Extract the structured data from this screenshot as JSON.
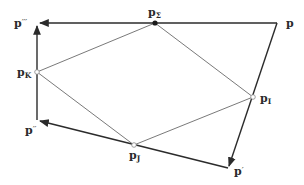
{
  "diagram": {
    "colors": {
      "arrow": "#2b2b2b",
      "thin": "#6a6a6a",
      "label": "#2a2a2a",
      "background": "#ffffff"
    },
    "points": {
      "p": {
        "base": "p",
        "sub": "",
        "sup": "",
        "x": 277,
        "y": 23
      },
      "p_sigma": {
        "base": "p",
        "sub": "Σ",
        "sup": "",
        "x": 155,
        "y": 23
      },
      "p_triple": {
        "base": "p",
        "sub": "",
        "sup": "′′′",
        "x": 37,
        "y": 23
      },
      "p_K": {
        "base": "p",
        "sub": "K",
        "sup": "",
        "x": 37,
        "y": 72
      },
      "p_double": {
        "base": "p",
        "sub": "",
        "sup": "′′",
        "x": 37,
        "y": 120
      },
      "p_J": {
        "base": "p",
        "sub": "J",
        "sup": "",
        "x": 134,
        "y": 145
      },
      "p_I": {
        "base": "p",
        "sub": "I",
        "sup": "",
        "x": 253,
        "y": 97
      },
      "p_prime": {
        "base": "p",
        "sub": "",
        "sup": "′",
        "x": 228,
        "y": 168
      }
    },
    "labels": {
      "p": "p",
      "p_sigma_base": "p",
      "p_sigma_sub": "Σ",
      "p_triple_base": "p",
      "p_triple_sup": "′′′",
      "p_K_base": "p",
      "p_K_sub": "K",
      "p_double_base": "p",
      "p_double_sup": "′′",
      "p_J_base": "p",
      "p_J_sub": "J",
      "p_I_base": "p",
      "p_I_sub": "I",
      "p_prime_base": "p",
      "p_prime_sup": "′"
    },
    "arrows": [
      {
        "from": "p",
        "to": "p_triple"
      },
      {
        "from": "p",
        "to": "p_prime"
      },
      {
        "from": "p_prime",
        "to": "p_double"
      },
      {
        "from": "p_double",
        "to": "p_triple"
      }
    ],
    "thin_edges": [
      {
        "from": "p_sigma",
        "to": "p_I"
      },
      {
        "from": "p_I",
        "to": "p_J"
      },
      {
        "from": "p_J",
        "to": "p_K"
      },
      {
        "from": "p_K",
        "to": "p_sigma"
      }
    ],
    "point_markers": {
      "filled": [
        "p_sigma"
      ],
      "hollow": [
        "p_K",
        "p_J",
        "p_I"
      ]
    }
  }
}
